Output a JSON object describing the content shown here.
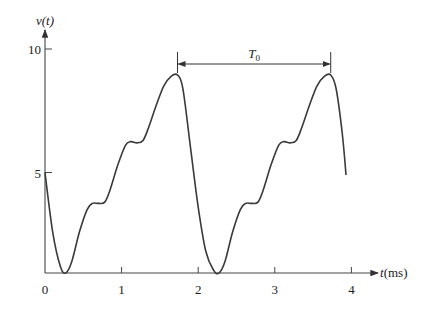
{
  "chart_data": {
    "type": "line",
    "title": "",
    "ylabel": "v(t)",
    "xlabel": "t(ms)",
    "xlim": [
      0,
      4.2
    ],
    "ylim": [
      0.9,
      10.8
    ],
    "x_axis_crosses_y_at": 0.93,
    "xticks": [
      0,
      1,
      2,
      3,
      4
    ],
    "xtick_labels": [
      "0",
      "1",
      "2",
      "3",
      "4"
    ],
    "yticks": [
      5,
      10
    ],
    "ytick_labels": [
      "5",
      "10"
    ],
    "grid": false,
    "legend": "none",
    "annotation": {
      "label": "T",
      "subscript": "0",
      "from_t": 1.73,
      "to_t": 3.73,
      "description": "period between successive peaks"
    },
    "series": [
      {
        "name": "v(t)",
        "color": "#3a3a3a",
        "x": [
          0,
          0.1,
          0.2,
          0.27,
          0.35,
          0.45,
          0.55,
          0.62,
          0.7,
          0.78,
          0.85,
          0.95,
          1.05,
          1.12,
          1.2,
          1.28,
          1.35,
          1.45,
          1.55,
          1.65,
          1.73,
          1.8,
          1.9,
          2.0,
          2.1,
          2.2,
          2.27,
          2.35,
          2.45,
          2.55,
          2.62,
          2.7,
          2.78,
          2.85,
          2.95,
          3.05,
          3.12,
          3.2,
          3.28,
          3.35,
          3.45,
          3.55,
          3.65,
          3.73,
          3.8,
          3.88,
          3.93
        ],
        "y": [
          5.0,
          2.6,
          1.2,
          0.93,
          1.4,
          2.6,
          3.5,
          3.75,
          3.75,
          3.8,
          4.3,
          5.3,
          6.1,
          6.25,
          6.2,
          6.3,
          6.8,
          7.7,
          8.5,
          8.9,
          8.95,
          8.4,
          6.0,
          3.6,
          1.8,
          1.05,
          0.93,
          1.4,
          2.6,
          3.5,
          3.75,
          3.75,
          3.8,
          4.3,
          5.3,
          6.1,
          6.25,
          6.2,
          6.3,
          6.8,
          7.7,
          8.5,
          8.9,
          8.95,
          8.4,
          6.6,
          4.9
        ]
      }
    ]
  }
}
